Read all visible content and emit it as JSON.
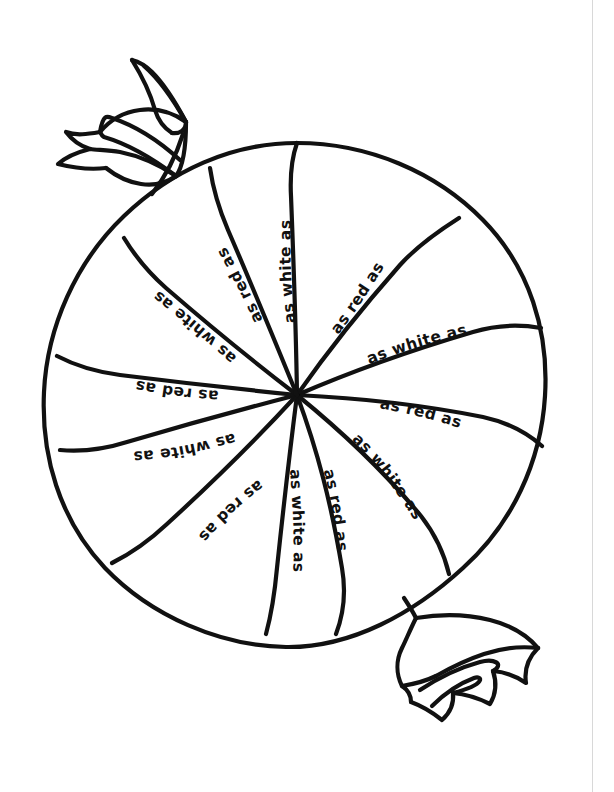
{
  "page": {
    "background_color": "#ffffff",
    "ink_color": "#111111",
    "width": 614,
    "height": 792
  },
  "artwork": {
    "name": "wrapped-swirl-candy",
    "description": "Black outline line-art of a round peppermint swirl candy in a twisted wrapper, each of the twelve spiral segments labeled with a simile phrase.",
    "style": "coloring-page-line-art",
    "center": {
      "x": 297,
      "y": 395
    },
    "radius": 252,
    "segment_count": 12,
    "wrapper_twists": [
      {
        "name": "top-left-wrapper-twist",
        "position": "top-left"
      },
      {
        "name": "bottom-right-wrapper-twist",
        "position": "bottom-right"
      }
    ]
  },
  "labels": [
    {
      "id": "seg-1",
      "text": "as white as",
      "color_word": "white",
      "angle_deg": 270,
      "orientation": "upright"
    },
    {
      "id": "seg-2",
      "text": "as red as",
      "color_word": "red",
      "angle_deg": 305,
      "orientation": "upright"
    },
    {
      "id": "seg-3",
      "text": "as white as",
      "color_word": "white",
      "angle_deg": 340,
      "orientation": "upright"
    },
    {
      "id": "seg-4",
      "text": "as red as",
      "color_word": "red",
      "angle_deg": 15,
      "orientation": "upright"
    },
    {
      "id": "seg-5",
      "text": "as white as",
      "color_word": "white",
      "angle_deg": 50,
      "orientation": "upright"
    },
    {
      "id": "seg-6",
      "text": "as red as",
      "color_word": "red",
      "angle_deg": 85,
      "orientation": "rotated"
    },
    {
      "id": "seg-7",
      "text": "as white as",
      "color_word": "white",
      "angle_deg": 120,
      "orientation": "inverted"
    },
    {
      "id": "seg-8",
      "text": "as red as",
      "color_word": "red",
      "angle_deg": 155,
      "orientation": "inverted"
    },
    {
      "id": "seg-9",
      "text": "as white as",
      "color_word": "white",
      "angle_deg": 190,
      "orientation": "inverted"
    },
    {
      "id": "seg-10",
      "text": "as red as",
      "color_word": "red",
      "angle_deg": 225,
      "orientation": "inverted"
    },
    {
      "id": "seg-11",
      "text": "as white as",
      "color_word": "white",
      "angle_deg": 250,
      "orientation": "inverted"
    },
    {
      "id": "seg-12",
      "text": "as red as",
      "color_word": "red",
      "angle_deg": 268,
      "orientation": "rotated"
    }
  ]
}
